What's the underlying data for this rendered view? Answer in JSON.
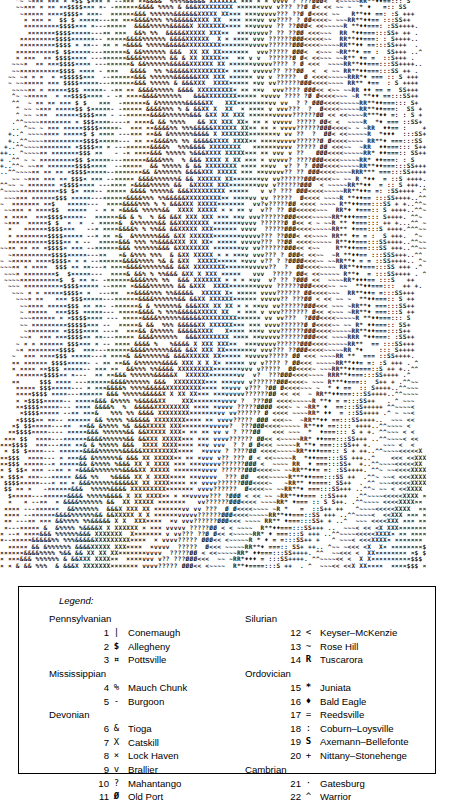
{
  "map": {
    "name": "ascii-geologic-map",
    "description": "Line-printer character map of Pennsylvania bedrock geology; each character code corresponds to a numbered legend unit.",
    "charset": [
      "¤",
      "$",
      "|",
      "%",
      "-",
      "&",
      "X",
      "x",
      "v",
      "?",
      "Ø",
      "<",
      "~",
      "R",
      "*",
      "♦",
      "=",
      ":",
      "S",
      "+",
      ".",
      "^"
    ],
    "rows": 90,
    "cols": 108
  },
  "legend": {
    "title": "Legend:",
    "groups_left": [
      {
        "period": "Pennsylvanian",
        "units": [
          {
            "num": "1",
            "symbol": "|",
            "name": "Conemaugh",
            "bold": false
          },
          {
            "num": "2",
            "symbol": "$",
            "name": "Allegheny",
            "bold": true
          },
          {
            "num": "3",
            "symbol": "¤",
            "name": "Pottsville",
            "bold": true
          }
        ]
      },
      {
        "period": "Mississippian",
        "units": [
          {
            "num": "4",
            "symbol": "%",
            "name": "Mauch Chunk",
            "bold": false
          },
          {
            "num": "5",
            "symbol": "-",
            "name": "Burgoon",
            "bold": false
          }
        ]
      },
      {
        "period": "Devonian",
        "units": [
          {
            "num": "6",
            "symbol": "&",
            "name": "Tioga",
            "bold": false
          },
          {
            "num": "7",
            "symbol": "X",
            "name": "Catskill",
            "bold": false
          },
          {
            "num": "8",
            "symbol": "×",
            "name": "Lock Haven",
            "bold": false
          },
          {
            "num": "9",
            "symbol": "v",
            "name": "Brallier",
            "bold": false
          },
          {
            "num": "10",
            "symbol": "?",
            "name": "Mahantango",
            "bold": false
          },
          {
            "num": "11",
            "symbol": "Ø",
            "name": "Old Port",
            "bold": true
          }
        ]
      }
    ],
    "groups_right": [
      {
        "period": "Silurian",
        "units": [
          {
            "num": "12",
            "symbol": "<",
            "name": "Keyser–McKenzie",
            "bold": false
          },
          {
            "num": "13",
            "symbol": "~",
            "name": "Rose Hill",
            "bold": false
          },
          {
            "num": "14",
            "symbol": "R",
            "name": "Tuscarora",
            "bold": true
          }
        ]
      },
      {
        "period": "Ordovician",
        "units": [
          {
            "num": "15",
            "symbol": "*",
            "name": "Juniata",
            "bold": true
          },
          {
            "num": "16",
            "symbol": "♦",
            "name": "Bald Eagle",
            "bold": true
          },
          {
            "num": "17",
            "symbol": "=",
            "name": "Reedsville",
            "bold": false
          },
          {
            "num": "18",
            "symbol": ":",
            "name": "Coburn–Loysville",
            "bold": false
          },
          {
            "num": "19",
            "symbol": "S",
            "name": "Axemann–Bellefonte",
            "bold": true
          },
          {
            "num": "20",
            "symbol": "+",
            "name": "Nittany–Stonehenge",
            "bold": false
          }
        ]
      },
      {
        "period": "Cambrian",
        "units": [
          {
            "num": "21",
            "symbol": "·",
            "name": "Gatesburg",
            "bold": false
          },
          {
            "num": "22",
            "symbol": "^",
            "name": "Warrior",
            "bold": false
          }
        ]
      }
    ]
  },
  "colors": {
    "ink": "#1a1a1a",
    "paper": "#ffffff",
    "border": "#000000"
  }
}
